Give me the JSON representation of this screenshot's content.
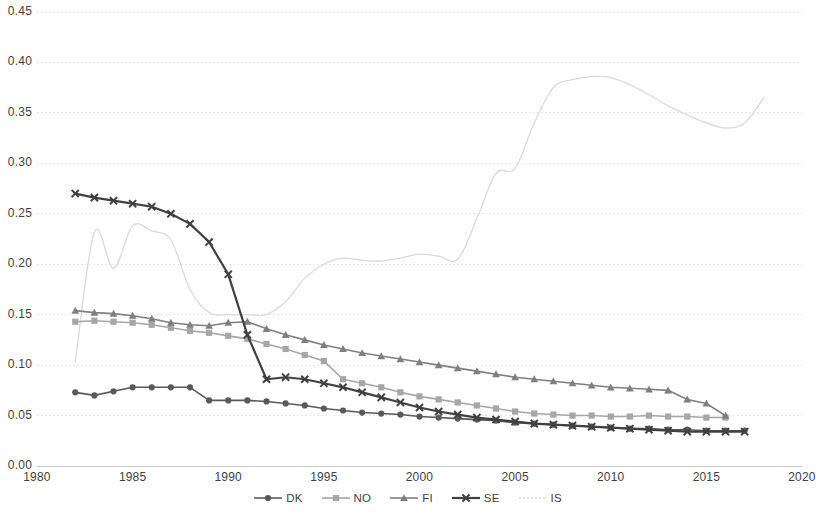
{
  "chart_data": {
    "type": "line",
    "title": "",
    "subtitle": "",
    "xlabel": "",
    "ylabel": "",
    "xlim": [
      1980,
      2020
    ],
    "ylim": [
      0.0,
      0.45
    ],
    "grid": true,
    "grid_axis": "y",
    "legend_position": "bottom",
    "x_ticks": [
      "1980",
      "1985",
      "1990",
      "1995",
      "2000",
      "2005",
      "2010",
      "2015",
      "2020"
    ],
    "y_ticks": [
      "0.00",
      "0.05",
      "0.10",
      "0.15",
      "0.20",
      "0.25",
      "0.30",
      "0.35",
      "0.40",
      "0.45"
    ],
    "x_tick_values": [
      1980,
      1985,
      1990,
      1995,
      2000,
      2005,
      2010,
      2015,
      2020
    ],
    "y_tick_values": [
      0.0,
      0.05,
      0.1,
      0.15,
      0.2,
      0.25,
      0.3,
      0.35,
      0.4,
      0.45
    ],
    "series": [
      {
        "name": "DK",
        "color": "#595959",
        "marker": "circle",
        "line_width": 1.6,
        "x": [
          1982,
          1983,
          1984,
          1985,
          1986,
          1987,
          1988,
          1989,
          1990,
          1991,
          1992,
          1993,
          1994,
          1995,
          1996,
          1997,
          1998,
          1999,
          2000,
          2001,
          2002,
          2003,
          2004,
          2005,
          2006,
          2007,
          2008,
          2009,
          2010,
          2011,
          2012,
          2013,
          2014,
          2015,
          2016,
          2017
        ],
        "values": [
          0.073,
          0.07,
          0.074,
          0.078,
          0.078,
          0.078,
          0.078,
          0.065,
          0.065,
          0.065,
          0.064,
          0.062,
          0.06,
          0.057,
          0.055,
          0.053,
          0.052,
          0.051,
          0.049,
          0.048,
          0.047,
          0.046,
          0.045,
          0.043,
          0.042,
          0.041,
          0.04,
          0.039,
          0.038,
          0.037,
          0.037,
          0.036,
          0.036,
          0.035,
          0.035,
          0.035
        ]
      },
      {
        "name": "NO",
        "color": "#a6a6a6",
        "marker": "square",
        "line_width": 1.6,
        "x": [
          1982,
          1983,
          1984,
          1985,
          1986,
          1987,
          1988,
          1989,
          1990,
          1991,
          1992,
          1993,
          1994,
          1995,
          1996,
          1997,
          1998,
          1999,
          2000,
          2001,
          2002,
          2003,
          2004,
          2005,
          2006,
          2007,
          2008,
          2009,
          2010,
          2011,
          2012,
          2013,
          2014,
          2015,
          2016
        ],
        "values": [
          0.143,
          0.144,
          0.143,
          0.142,
          0.14,
          0.137,
          0.134,
          0.132,
          0.129,
          0.126,
          0.121,
          0.116,
          0.11,
          0.104,
          0.086,
          0.082,
          0.078,
          0.073,
          0.069,
          0.066,
          0.063,
          0.06,
          0.057,
          0.054,
          0.052,
          0.051,
          0.05,
          0.05,
          0.049,
          0.049,
          0.05,
          0.049,
          0.049,
          0.048,
          0.048
        ]
      },
      {
        "name": "FI",
        "color": "#7f7f7f",
        "marker": "triangle",
        "line_width": 1.6,
        "x": [
          1982,
          1983,
          1984,
          1985,
          1986,
          1987,
          1988,
          1989,
          1990,
          1991,
          1992,
          1993,
          1994,
          1995,
          1996,
          1997,
          1998,
          1999,
          2000,
          2001,
          2002,
          2003,
          2004,
          2005,
          2006,
          2007,
          2008,
          2009,
          2010,
          2011,
          2012,
          2013,
          2014,
          2015,
          2016
        ],
        "values": [
          0.154,
          0.152,
          0.151,
          0.149,
          0.146,
          0.142,
          0.14,
          0.139,
          0.142,
          0.143,
          0.136,
          0.13,
          0.125,
          0.12,
          0.116,
          0.112,
          0.109,
          0.106,
          0.103,
          0.1,
          0.097,
          0.094,
          0.091,
          0.088,
          0.086,
          0.084,
          0.082,
          0.08,
          0.078,
          0.077,
          0.076,
          0.075,
          0.066,
          0.062,
          0.05
        ]
      },
      {
        "name": "SE",
        "color": "#404040",
        "marker": "cross",
        "line_width": 2.2,
        "x": [
          1982,
          1983,
          1984,
          1985,
          1986,
          1987,
          1988,
          1989,
          1990,
          1991,
          1992,
          1993,
          1994,
          1995,
          1996,
          1997,
          1998,
          1999,
          2000,
          2001,
          2002,
          2003,
          2004,
          2005,
          2006,
          2007,
          2008,
          2009,
          2010,
          2011,
          2012,
          2013,
          2014,
          2015,
          2016,
          2017
        ],
        "values": [
          0.27,
          0.266,
          0.263,
          0.26,
          0.257,
          0.25,
          0.24,
          0.222,
          0.19,
          0.13,
          0.086,
          0.088,
          0.086,
          0.082,
          0.078,
          0.073,
          0.068,
          0.063,
          0.058,
          0.054,
          0.051,
          0.048,
          0.046,
          0.044,
          0.042,
          0.041,
          0.04,
          0.039,
          0.038,
          0.037,
          0.036,
          0.035,
          0.034,
          0.034,
          0.034,
          0.034
        ]
      },
      {
        "name": "IS",
        "color": "#d9d9d9",
        "marker": "none",
        "line_width": 1.3,
        "x": [
          1982,
          1983,
          1984,
          1985,
          1986,
          1987,
          1988,
          1989,
          1990,
          1991,
          1992,
          1993,
          1994,
          1995,
          1996,
          1997,
          1998,
          1999,
          2000,
          2001,
          2002,
          2003,
          2004,
          2005,
          2006,
          2007,
          2008,
          2009,
          2010,
          2011,
          2012,
          2013,
          2014,
          2015,
          2016,
          2017,
          2018
        ],
        "values": [
          0.103,
          0.232,
          0.196,
          0.238,
          0.233,
          0.224,
          0.175,
          0.152,
          0.15,
          0.15,
          0.15,
          0.163,
          0.186,
          0.2,
          0.206,
          0.204,
          0.203,
          0.206,
          0.21,
          0.208,
          0.205,
          0.245,
          0.29,
          0.295,
          0.34,
          0.375,
          0.383,
          0.386,
          0.385,
          0.378,
          0.368,
          0.357,
          0.348,
          0.34,
          0.335,
          0.34,
          0.365
        ]
      }
    ]
  },
  "legend": {
    "items": [
      {
        "label": "DK",
        "color": "#595959",
        "marker": "circle"
      },
      {
        "label": "NO",
        "color": "#a6a6a6",
        "marker": "square"
      },
      {
        "label": "FI",
        "color": "#7f7f7f",
        "marker": "triangle"
      },
      {
        "label": "SE",
        "color": "#404040",
        "marker": "cross"
      },
      {
        "label": "IS",
        "color": "#d9d9d9",
        "marker": "none"
      }
    ]
  },
  "colors": {
    "grid": "#e8e8e8",
    "axis": "#d0d0d0",
    "text": "#3f3f3f",
    "background": "#ffffff"
  }
}
